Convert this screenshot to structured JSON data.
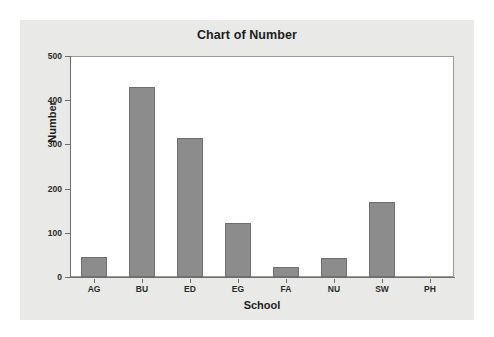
{
  "chart_data": {
    "type": "bar",
    "title": "Chart of Number",
    "xlabel": "School",
    "ylabel": "Number",
    "categories": [
      "AG",
      "BU",
      "ED",
      "EG",
      "FA",
      "NU",
      "SW",
      "PH"
    ],
    "values": [
      45,
      430,
      315,
      123,
      23,
      43,
      170,
      0
    ],
    "ylim": [
      0,
      500
    ],
    "yticks": [
      0,
      100,
      200,
      300,
      400,
      500
    ],
    "ytick_labels": [
      "0",
      "100",
      "200",
      "300",
      "400",
      "500"
    ],
    "grid": false,
    "legend": false,
    "bar_color": "#8c8c8c",
    "bar_edge_color": "#6f6f6f",
    "plot_background": "#ffffff",
    "figure_background": "#e9e9e7",
    "axis_color": "#6e6e6e",
    "text_color": "#1d1d1d"
  }
}
